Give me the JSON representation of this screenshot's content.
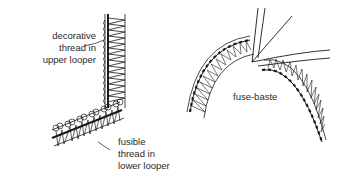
{
  "figure": {
    "left_panel": {
      "labels": [
        {
          "line1": "decorative",
          "line2": "thread in",
          "line3": "upper looper"
        },
        {
          "line1": "fusible",
          "line2": "thread in",
          "line3": "lower looper"
        }
      ]
    },
    "right_panel": {
      "labels": [
        {
          "text": "fuse-baste"
        }
      ]
    },
    "colors": {
      "ink": "#1a1a1a",
      "background": "#ffffff"
    }
  }
}
